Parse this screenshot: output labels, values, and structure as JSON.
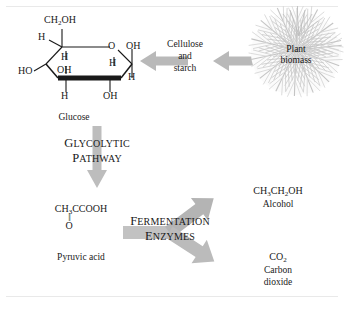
{
  "figure": {
    "background_color": "#ffffff",
    "arrow_color": "#b0b0b0",
    "bond_color": "#191919"
  },
  "glucose": {
    "caption": "Glucose",
    "top_group": "CH",
    "top_group_sub": "2",
    "top_group_tail": "OH",
    "ring_oxygen": "O",
    "substituents": {
      "upper_left_h": "H",
      "right_oh": "OH",
      "inner_h": "H",
      "inner_oh": "OH",
      "inner_h2": "H",
      "left_ho": "HO",
      "right_h": "H",
      "bottom_h": "H",
      "bottom_oh": "OH"
    }
  },
  "cellulose": {
    "line1": "Cellulose",
    "line2": "and",
    "line3": "starch"
  },
  "plant_biomass": {
    "line1": "Plant",
    "line2": "biomass"
  },
  "glycolysis": {
    "label_line1_first": "G",
    "label_line1_rest": "LYCOLYTIC",
    "label_line2_first": "P",
    "label_line2_rest": "ATHWAY"
  },
  "pyruvic_acid": {
    "formula_main": "CH",
    "formula_sub": "3",
    "formula_tail": "CCOOH",
    "double_bond": "||",
    "carbonyl_oxygen": "O",
    "caption": "Pyruvic acid"
  },
  "fermentation": {
    "label_line1_first": "F",
    "label_line1_rest": "ERMENTATION",
    "label_line2_first": "E",
    "label_line2_rest": "NZYMES"
  },
  "alcohol": {
    "formula_a": "CH",
    "formula_a_sub": "3",
    "formula_b": "CH",
    "formula_b_sub": "2",
    "formula_c": "OH",
    "caption": "Alcohol"
  },
  "carbon_dioxide": {
    "formula": "CO",
    "formula_sub": "2",
    "caption_line1": "Carbon",
    "caption_line2": "dioxide"
  }
}
